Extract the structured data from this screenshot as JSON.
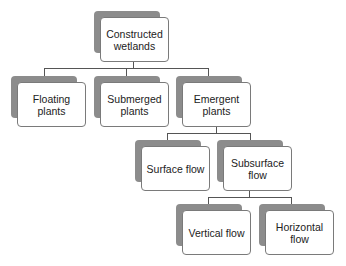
{
  "diagram": {
    "type": "hierarchy",
    "root": {
      "id": "constructed-wetlands",
      "label": "Constructed wetlands"
    },
    "nodes": {
      "constructed_wetlands": "Constructed\nwetlands",
      "floating_plants": "Floating\nplants",
      "submerged_plants": "Submerged\nplants",
      "emergent_plants": "Emergent\nplants",
      "surface_flow": "Surface flow",
      "subsurface_flow": "Subsurface\nflow",
      "vertical_flow": "Vertical flow",
      "horizontal_flow": "Horizontal\nflow"
    },
    "edges": [
      [
        "Constructed wetlands",
        "Floating plants"
      ],
      [
        "Constructed wetlands",
        "Submerged plants"
      ],
      [
        "Constructed wetlands",
        "Emergent plants"
      ],
      [
        "Emergent plants",
        "Surface flow"
      ],
      [
        "Emergent plants",
        "Subsurface flow"
      ],
      [
        "Subsurface flow",
        "Vertical flow"
      ],
      [
        "Subsurface flow",
        "Horizontal flow"
      ]
    ],
    "colors": {
      "shadow": "#8c8c8c",
      "border": "#7a7a7a",
      "connector": "#555555",
      "box_fill": "#ffffff"
    }
  }
}
